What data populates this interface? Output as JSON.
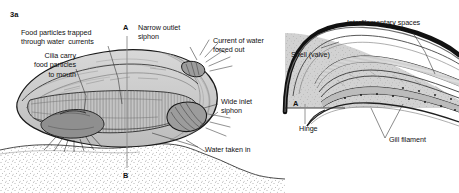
{
  "figure": {
    "panels": [
      {
        "key": "3a",
        "name": "freshwater-mussel-whole-animal",
        "labels": [
          {
            "id": "food-particles-trapped",
            "text": "Food particles trapped\nthrough water  currents"
          },
          {
            "id": "cilia-carry-food",
            "text": "Cilia carry\nfood particles\nto mouth"
          },
          {
            "id": "narrow-outlet-siphon",
            "text": "Narrow outlet\nsiphon"
          },
          {
            "id": "current-of-water-forced-out",
            "text": "Current of water\nforced out"
          },
          {
            "id": "wide-inlet-siphon",
            "text": "Wide inlet\nsiphon"
          },
          {
            "id": "water-taken-in",
            "text": "Water taken in"
          }
        ],
        "section_markers": [
          {
            "id": "section-marker-a",
            "text": "A"
          },
          {
            "id": "section-marker-b",
            "text": "B"
          }
        ]
      },
      {
        "key": "3b",
        "name": "mussel-gill-section",
        "labels": [
          {
            "id": "interfilamentary-spaces",
            "text": "Interfilamentary spaces"
          },
          {
            "id": "shell-valve",
            "text": "Shell (valve)"
          },
          {
            "id": "hinge",
            "text": "Hinge"
          },
          {
            "id": "gill-filament",
            "text": "Gill filament"
          }
        ],
        "section_markers": [
          {
            "id": "section-marker-a",
            "text": "A"
          }
        ]
      }
    ],
    "colors": {
      "ink": "#111111",
      "shell_fill": "#cdcdcd",
      "body_fill": "#e2e2e2",
      "mantle_fill": "#d6d6d6",
      "gill_fill": "#bdbdbd",
      "substrate_stipple": "#555555",
      "background": "#ffffff"
    }
  }
}
